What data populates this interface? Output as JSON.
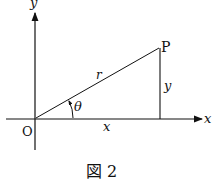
{
  "diagram": {
    "labels": {
      "y_axis": "y",
      "x_axis": "x",
      "origin": "O",
      "point": "P",
      "radius": "r",
      "angle": "θ",
      "vertical_leg": "y",
      "horizontal_leg": "x"
    },
    "caption": "図 2",
    "colors": {
      "ink": "#111111",
      "background": "#ffffff"
    }
  }
}
